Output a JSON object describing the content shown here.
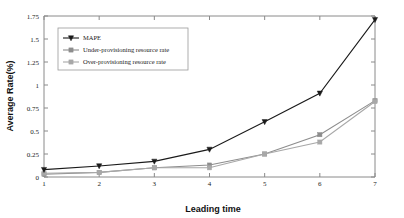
{
  "chart_data": {
    "type": "line",
    "title": "",
    "xlabel": "Leading time",
    "ylabel": "Average Rate(%)",
    "x": [
      1,
      2,
      3,
      4,
      5,
      6,
      7
    ],
    "xlim": [
      1,
      7
    ],
    "ylim": [
      0,
      1.75
    ],
    "xticks": [
      "1",
      "2",
      "3",
      "4",
      "5",
      "6",
      "7"
    ],
    "yticks": [
      "0",
      "0.25",
      "0.5",
      "0.75",
      "1",
      "1.25",
      "1.5",
      "1.75"
    ],
    "ytick_values": [
      0,
      0.25,
      0.5,
      0.75,
      1,
      1.25,
      1.5,
      1.75
    ],
    "grid": false,
    "legend_position": "upper-left",
    "series": [
      {
        "name": "MAPE",
        "values": [
          0.08,
          0.12,
          0.17,
          0.3,
          0.6,
          0.91,
          1.71
        ],
        "color": "#1a1a1a",
        "marker": "triangle-down"
      },
      {
        "name": "Under-provisioning resource rate",
        "values": [
          0.03,
          0.05,
          0.1,
          0.13,
          0.25,
          0.46,
          0.83
        ],
        "color": "#8d8d8d",
        "marker": "square"
      },
      {
        "name": "Over-provisioning resource rate",
        "values": [
          0.04,
          0.05,
          0.1,
          0.1,
          0.25,
          0.38,
          0.82
        ],
        "color": "#a8a8a8",
        "marker": "square"
      }
    ]
  }
}
